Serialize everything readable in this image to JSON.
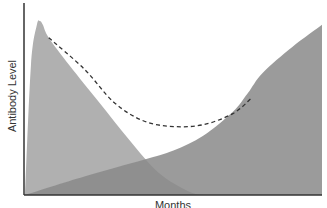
{
  "chart_data": {
    "type": "area",
    "title": "",
    "xlabel": "Months",
    "ylabel": "Antibody Level",
    "xlim": [
      0,
      100
    ],
    "ylim": [
      0,
      100
    ],
    "grid": false,
    "legend": "none",
    "series": [
      {
        "name": "Maternal antibodies",
        "color": "#b0b0b0",
        "x": [
          0,
          2,
          4,
          5,
          6,
          8,
          15,
          25,
          35,
          45,
          55,
          60
        ],
        "y": [
          0,
          70,
          92,
          94,
          92,
          85,
          70,
          50,
          30,
          12,
          2,
          0
        ]
      },
      {
        "name": "Infant antibodies",
        "color": "#8a8a8a",
        "x": [
          0,
          20,
          40,
          50,
          60,
          70,
          75,
          80,
          90,
          100
        ],
        "y": [
          0,
          10,
          19,
          24,
          32,
          45,
          55,
          66,
          80,
          92
        ]
      },
      {
        "name": "Total antibodies",
        "style": "dashed",
        "color": "#333333",
        "x": [
          8,
          20,
          30,
          40,
          50,
          60,
          70,
          76
        ],
        "y": [
          85,
          68,
          50,
          40,
          37,
          38,
          44,
          52
        ]
      }
    ]
  }
}
